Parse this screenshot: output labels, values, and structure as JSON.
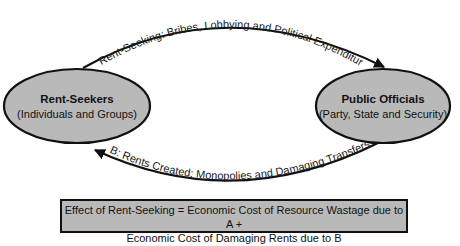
{
  "diagram": {
    "nodes": [
      {
        "id": "rent-seekers",
        "title": "Rent-Seekers",
        "subtitle": "(Individuals and Groups)"
      },
      {
        "id": "public-officials",
        "title": "Public Officials",
        "subtitle": "(Party, State and Security)"
      }
    ],
    "edges": [
      {
        "id": "A",
        "from": "rent-seekers",
        "to": "public-officials",
        "label": "A: Rent-Seeking: Bribes, Lobbying and Political Expenditures"
      },
      {
        "id": "B",
        "from": "public-officials",
        "to": "rent-seekers",
        "label": "B: Rents Created: Monopolies and Damaging Transfers"
      }
    ],
    "summary": {
      "line1": "Effect of Rent-Seeking = Economic Cost of Resource Wastage due to A +",
      "line2": "Economic Cost of Damaging Rents due to B"
    },
    "colors": {
      "node_fill": "#b9b9b9",
      "stroke": "#111111",
      "box_fill": "#b9b9b9"
    }
  }
}
